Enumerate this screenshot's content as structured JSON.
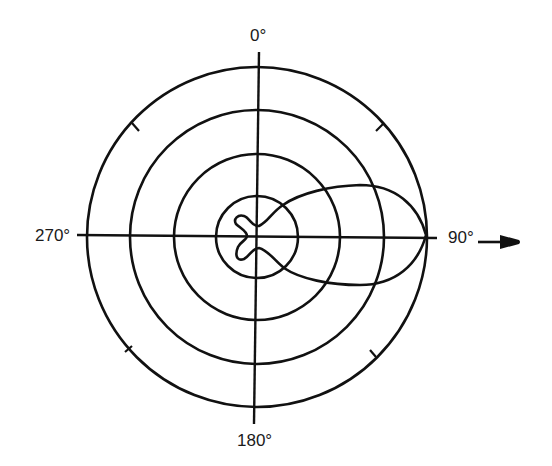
{
  "diagram": {
    "type": "polar-radiation-pattern",
    "labels": {
      "top": "0°",
      "right": "90°",
      "bottom": "180°",
      "left": "270°"
    },
    "rings": 4,
    "tick_marks_on_outer_ring": [
      "45°",
      "135°",
      "225°",
      "315°"
    ],
    "direction_arrow": "points toward 90°",
    "pattern": {
      "main_lobe_direction": "90°",
      "description": "Directional main lobe toward 90° reaching the outer ring, with small back/side lobes inside the innermost ring"
    },
    "colors": {
      "line": "#111111",
      "background": "#ffffff"
    }
  }
}
